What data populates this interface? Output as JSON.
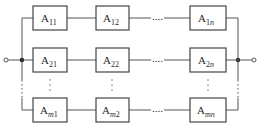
{
  "diagram": {
    "type": "series-parallel reliability block diagram",
    "colors": {
      "line": "#555555",
      "box_border": "#444444",
      "text": "#2a2a2a",
      "background": "#ffffff"
    },
    "rows": [
      {
        "id": "row-1",
        "blocks": [
          {
            "base": "A",
            "sub_plain": "11",
            "sub_italic": ""
          },
          {
            "base": "A",
            "sub_plain": "12",
            "sub_italic": ""
          },
          {
            "base": "A",
            "sub_plain": "1",
            "sub_italic": "n"
          }
        ]
      },
      {
        "id": "row-2",
        "blocks": [
          {
            "base": "A",
            "sub_plain": "2",
            "sub_italic": ""
          },
          {
            "base": "A",
            "sub_plain": "22",
            "sub_italic": ""
          },
          {
            "base": "A",
            "sub_plain": "2",
            "sub_italic": "n"
          }
        ]
      },
      {
        "id": "row-m",
        "blocks": [
          {
            "base": "A",
            "sub_plain": "1",
            "sub_italic": "m"
          },
          {
            "base": "A",
            "sub_plain": "2",
            "sub_italic": "m"
          },
          {
            "base": "A",
            "sub_plain": "",
            "sub_italic": "mn"
          }
        ]
      }
    ],
    "labels": {
      "r1c1": "11",
      "r1c2": "12",
      "r1c3_plain": "1",
      "r1c3_ital": "n",
      "r2c1": "21",
      "r2c2": "22",
      "r2c3_plain": "2",
      "r2c3_ital": "n",
      "rmc1_ital": "m",
      "rmc1_plain": "1",
      "rmc2_ital": "m",
      "rmc2_plain": "2",
      "rmc3_ital": "mn",
      "base": "A"
    },
    "ellipsis_horizontal": "....",
    "ellipsis_vertical": "⋮",
    "terminals": [
      "input",
      "output"
    ]
  }
}
